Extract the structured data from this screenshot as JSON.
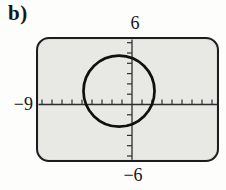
{
  "figure": {
    "part_label": "b)",
    "window_labels": {
      "top": "6",
      "left": "−9",
      "bottom": "−6"
    }
  },
  "chart_data": {
    "type": "line",
    "xlim": [
      -9,
      9
    ],
    "ylim": [
      -6,
      6
    ],
    "x_tick_interval": 1,
    "y_tick_interval": 1,
    "grid": false,
    "axis_value_labels": [
      {
        "text": "6",
        "position": "top-center-of-y-axis"
      },
      {
        "text": "−9",
        "position": "left-of-x-axis"
      },
      {
        "text": "−6",
        "position": "bottom-center-of-y-axis"
      }
    ],
    "shapes": [
      {
        "shape": "circle",
        "center_x": -1.3,
        "center_y": 1.3,
        "radius": 3.5
      }
    ],
    "colors": {
      "axis": "#2e2e2e",
      "curve": "#101010",
      "screen_bg": "#e8e8e5",
      "screen_border": "#1d1d1d"
    }
  }
}
